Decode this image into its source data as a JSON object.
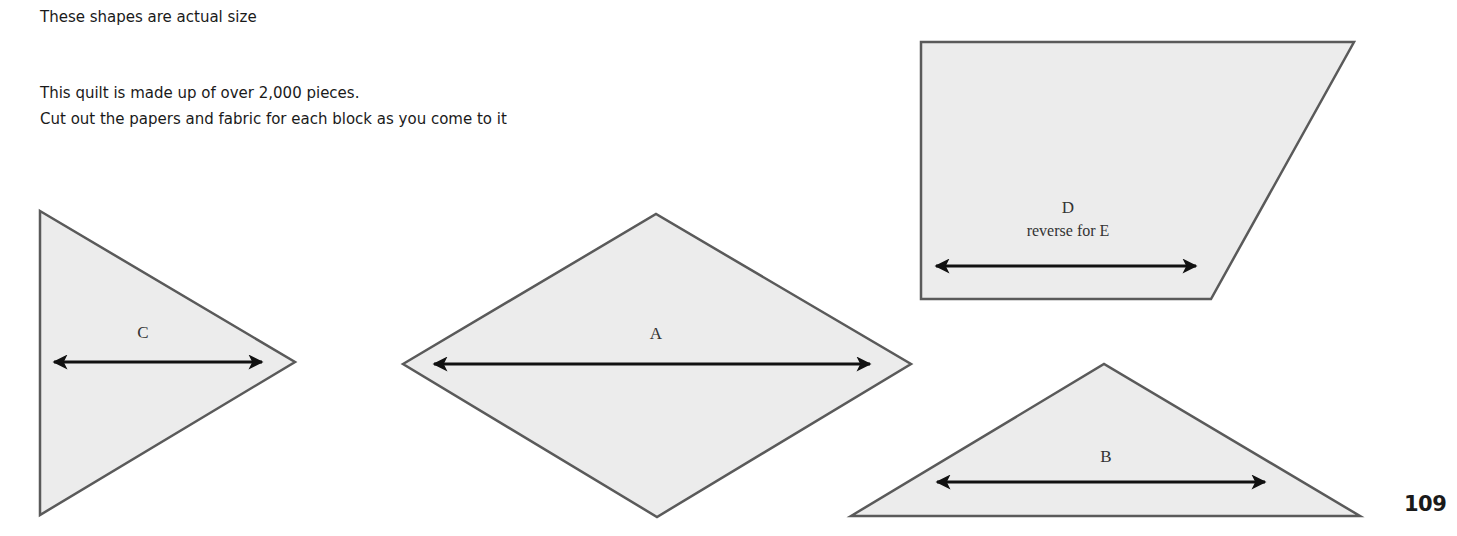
{
  "text": {
    "header": "These shapes are actual size",
    "line1": "This quilt is made up of over 2,000 pieces.",
    "line2": "Cut out the papers and fabric for each block as you come to it"
  },
  "page_number": "109",
  "shapes": {
    "C": {
      "label": "C",
      "type": "triangle",
      "grain_arrow": "double-headed horizontal"
    },
    "A": {
      "label": "A",
      "type": "diamond",
      "grain_arrow": "double-headed horizontal"
    },
    "D": {
      "label": "D",
      "sublabel": "reverse for E",
      "type": "trapezoid",
      "grain_arrow": "double-headed horizontal"
    },
    "B": {
      "label": "B",
      "type": "triangle",
      "grain_arrow": "double-headed horizontal"
    }
  },
  "colors": {
    "shape_fill": "#ececec",
    "shape_stroke": "#5a5a5a",
    "arrow": "#111111",
    "text": "#1a1a1a"
  }
}
